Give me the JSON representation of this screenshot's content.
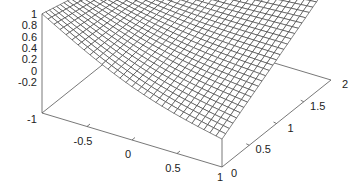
{
  "chart_data": {
    "type": "surface3d",
    "title": "",
    "xlabel": "",
    "ylabel": "",
    "zlabel": "",
    "x_ticks": [
      "-1",
      "-0.5",
      "0",
      "0.5",
      "1"
    ],
    "y_ticks": [
      "0",
      "0.5",
      "1",
      "1.5",
      "2"
    ],
    "z_ticks": [
      "1",
      "0.8",
      "0.6",
      "0.4",
      "0.2",
      "0",
      "-0.2"
    ],
    "xlim": [
      -1,
      1
    ],
    "ylim": [
      0,
      2
    ],
    "zlim": [
      -0.3,
      1
    ],
    "grid": false,
    "mesh": {
      "nx": 30,
      "ny": 30
    },
    "corner_values": {
      "x=-1,y=0": 1.0,
      "x=1,y=0": -0.25,
      "x=-1,y=2": 0.45,
      "x=1,y=2": 1.0
    },
    "line_color": "#333333",
    "box_color": "#555555"
  }
}
